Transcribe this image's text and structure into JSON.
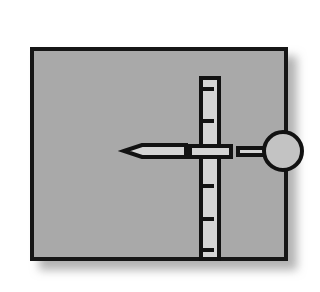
{
  "figure": {
    "type": "technical-line-diagram",
    "canvas": {
      "width": 320,
      "height": 292
    },
    "background_color": "#ffffff"
  },
  "panel": {
    "name": "enclosure-rectangle",
    "fill_color": "#a9a9a9",
    "stroke_color": "#121212",
    "stroke_width": 4,
    "x": 30,
    "y": 47,
    "width": 258,
    "height": 214,
    "shadow": {
      "color": "#b4b4b4",
      "offset_x": 9,
      "offset_y": 9,
      "blur": 9
    }
  },
  "track": {
    "name": "vertical-slider-track",
    "fill_color": "#d4d4d4",
    "stroke_color": "#121212",
    "stroke_width": 4,
    "x": 199,
    "y": 76,
    "width": 22,
    "height": 185,
    "ticks": {
      "count": 5,
      "color": "#121212",
      "thickness": 4,
      "length": 13,
      "side": "left",
      "y_positions": [
        89,
        121,
        186,
        219,
        250
      ]
    }
  },
  "handle": {
    "name": "slider-crossbar-handle",
    "fill_color": "#d4d4d4",
    "stroke_color": "#121212",
    "stroke_width": 4,
    "x": 188,
    "y": 144,
    "width": 45,
    "height": 15
  },
  "pointer": {
    "name": "arrow-indicator",
    "fill_color": "#d4d4d4",
    "stroke_color": "#121212",
    "stroke_width": 4,
    "tip_x": 124,
    "tail_x": 186,
    "center_y": 151,
    "half_height": 6,
    "tip_half_height": 1,
    "direction": "left"
  },
  "connector": {
    "name": "connecting-rod",
    "fill_color": "#d4d4d4",
    "stroke_color": "#121212",
    "stroke_width": 4,
    "x": 236,
    "y": 146,
    "width": 34,
    "height": 11
  },
  "knob": {
    "name": "circular-knob",
    "fill_color": "#c3c3c3",
    "stroke_color": "#121212",
    "stroke_width": 4,
    "center_x": 283,
    "center_y": 151,
    "radius": 21
  },
  "colors": {
    "line": "#121212",
    "panel_gray": "#a9a9a9",
    "part_light_gray": "#d4d4d4",
    "knob_gray": "#c3c3c3",
    "shadow_gray": "#b4b4b4",
    "page_white": "#ffffff"
  }
}
